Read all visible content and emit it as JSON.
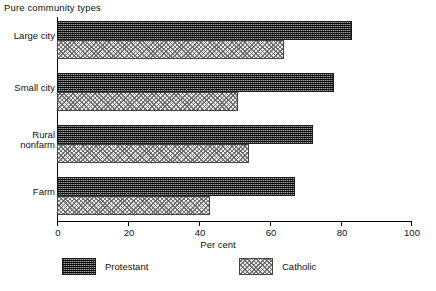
{
  "chart_data": {
    "type": "bar",
    "orientation": "horizontal",
    "title": "Pure community types",
    "xlabel": "Per cent",
    "ylabel": "",
    "xlim": [
      0,
      100
    ],
    "xticks": [
      0,
      20,
      40,
      60,
      80,
      100
    ],
    "xtick_labels": [
      "0",
      "20",
      "40",
      "60",
      "80",
      "100"
    ],
    "grid": false,
    "legend_position": "bottom",
    "categories": [
      "Large city",
      "Small city",
      "Rural\nnonfarm",
      "Farm"
    ],
    "series": [
      {
        "name": "Protestant",
        "values": [
          83,
          78,
          72,
          67
        ]
      },
      {
        "name": "Catholic",
        "values": [
          64,
          51,
          54,
          43
        ]
      }
    ]
  },
  "colors": {
    "protestant": "#333333",
    "catholic": "#e0e0e0",
    "axis": "#000000",
    "text": "#111111",
    "background": "#ffffff"
  },
  "axis": {
    "tick_0": "0",
    "tick_1": "20",
    "tick_2": "40",
    "tick_3": "60",
    "tick_4": "80",
    "tick_5": "100",
    "title": "Per cent"
  },
  "legend": {
    "protestant_label": "Protestant",
    "catholic_label": "Catholic"
  },
  "categories": {
    "c0": "Large city",
    "c1": "Small city",
    "c2_line1": "Rural",
    "c2_line2": "nonfarm",
    "c3": "Farm"
  }
}
